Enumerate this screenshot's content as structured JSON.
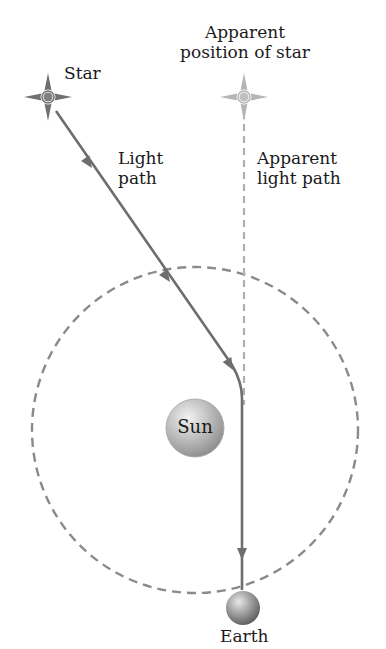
{
  "labels": {
    "star": "Star",
    "apparent_position_line1": "Apparent",
    "apparent_position_line2": "position of star",
    "light_path_line1": "Light",
    "light_path_line2": "path",
    "apparent_light_path_line1": "Apparent",
    "apparent_light_path_line2": "light path",
    "sun": "Sun",
    "earth": "Earth"
  },
  "colors": {
    "line": "#6e6e6e",
    "apparent_line": "#b0b0b0",
    "orbit": "#8a8a8a",
    "star": "#707070",
    "apparent_star": "#b5b5b5",
    "sun": "#bdbdbd",
    "earth": "#9a9a9a",
    "text": "#1a1a1a"
  },
  "icons": {
    "star": "four-point-star-icon",
    "apparent_star": "four-point-star-icon",
    "sun": "sphere-icon",
    "earth": "sphere-icon",
    "arrow": "arrowhead-icon"
  }
}
